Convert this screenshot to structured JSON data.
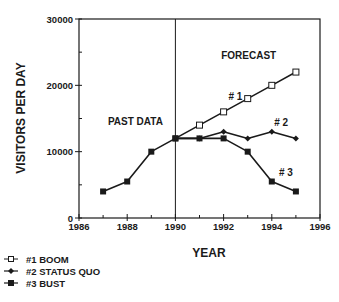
{
  "chart_data": {
    "type": "line",
    "title": "",
    "xlabel": "YEAR",
    "ylabel": "VISITORS PER DAY",
    "xlim": [
      1986,
      1996
    ],
    "ylim": [
      0,
      30000
    ],
    "x_ticks": [
      1986,
      1988,
      1990,
      1992,
      1994,
      1996
    ],
    "y_ticks": [
      0,
      10000,
      20000,
      30000
    ],
    "grid": false,
    "legend_position": "bottom-left",
    "divider_x": 1990,
    "past": {
      "x": [
        1987,
        1988,
        1989,
        1990
      ],
      "values": [
        4000,
        5500,
        10000,
        12000
      ]
    },
    "series": [
      {
        "name": "#1 BOOM",
        "marker": "open-square",
        "x": [
          1990,
          1991,
          1992,
          1993,
          1994,
          1995
        ],
        "values": [
          12000,
          14000,
          16000,
          18000,
          20000,
          22000
        ]
      },
      {
        "name": "#2 STATUS QUO",
        "marker": "diamond",
        "x": [
          1990,
          1991,
          1992,
          1993,
          1994,
          1995
        ],
        "values": [
          12000,
          12000,
          13000,
          12000,
          13000,
          12000
        ]
      },
      {
        "name": "#3 BUST",
        "marker": "filled-square",
        "x": [
          1990,
          1991,
          1992,
          1993,
          1994,
          1995
        ],
        "values": [
          12000,
          12000,
          12000,
          10000,
          5500,
          4000
        ]
      }
    ],
    "annotations": [
      {
        "text": "PAST DATA",
        "x": 1987.2,
        "y": 14000
      },
      {
        "text": "FORECAST",
        "x": 1991.9,
        "y": 24000
      },
      {
        "text": "# 1",
        "x": 1992.2,
        "y": 17800
      },
      {
        "text": "# 2",
        "x": 1994.1,
        "y": 13900
      },
      {
        "text": "# 3",
        "x": 1994.3,
        "y": 6300
      }
    ]
  },
  "colors": {
    "ink": "#1a1a1a",
    "background": "#ffffff"
  }
}
